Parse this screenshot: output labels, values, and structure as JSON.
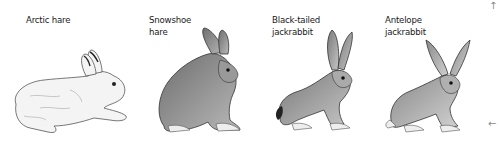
{
  "figure": {
    "animals": [
      {
        "label": "Arctic hare",
        "shading": "#e8e8e8",
        "pose": "lying"
      },
      {
        "label": "Snowshoe\nhare",
        "shading": "#8c8c8c",
        "pose": "sitting"
      },
      {
        "label": "Black-tailed\njackrabbit",
        "shading": "#9a9a9a",
        "pose": "sitting"
      },
      {
        "label": "Antelope\njackrabbit",
        "shading": "#a8a8a8",
        "pose": "sitting"
      }
    ],
    "arrows": {
      "top": "↑",
      "bottom": "←"
    }
  }
}
